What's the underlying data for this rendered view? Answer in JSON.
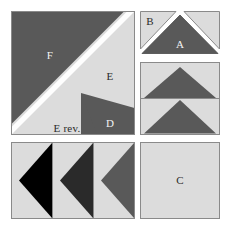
{
  "diagram": {
    "canvas": {
      "width": 231,
      "height": 230,
      "background": "#ffffff"
    },
    "colors": {
      "dark_gray": "#595959",
      "light_gray": "#dcdcdc",
      "black": "#000000",
      "charcoal": "#2a2a2a",
      "outline": "#8a8a8a",
      "background": "#ffffff",
      "label_light": "#f2f2f2",
      "label_dark": "#2b2b2b"
    },
    "units": [
      {
        "id": "unit-f-e-d",
        "name": "large-square-unit",
        "shape": "square",
        "pieces": [
          {
            "label": "F",
            "shade": "dark_gray",
            "label_color": "light"
          },
          {
            "label": "E",
            "shade": "light_gray",
            "label_color": "dark"
          },
          {
            "label": "D",
            "shade": "dark_gray",
            "label_color": "light"
          },
          {
            "label": "E rev.",
            "shade": "light_gray",
            "label_color": "dark"
          }
        ]
      },
      {
        "id": "unit-b-a",
        "name": "peak-unit",
        "shape": "rectangle",
        "pieces": [
          {
            "label": "B",
            "shade": "light_gray",
            "label_color": "dark"
          },
          {
            "label": "A",
            "shade": "dark_gray",
            "label_color": "light"
          }
        ]
      },
      {
        "id": "unit-flying-geese",
        "name": "flying-geese-unit",
        "shape": "rectangle",
        "pieces": [
          {
            "label": "",
            "shade": "dark_gray",
            "label_color": "light"
          },
          {
            "label": "",
            "shade": "dark_gray",
            "label_color": "light"
          }
        ]
      },
      {
        "id": "unit-arrows",
        "name": "arrow-strip-unit",
        "shape": "rectangle",
        "pieces": [
          {
            "label": "",
            "shade": "black",
            "label_color": "light"
          },
          {
            "label": "",
            "shade": "charcoal",
            "label_color": "light"
          },
          {
            "label": "",
            "shade": "dark_gray",
            "label_color": "light"
          }
        ]
      },
      {
        "id": "unit-c",
        "name": "plain-square-unit",
        "shape": "square",
        "pieces": [
          {
            "label": "C",
            "shade": "light_gray",
            "label_color": "dark"
          }
        ]
      }
    ],
    "labels": {
      "f": "F",
      "e": "E",
      "d": "D",
      "e_rev": "E rev.",
      "b": "B",
      "a": "A",
      "c": "C"
    }
  }
}
